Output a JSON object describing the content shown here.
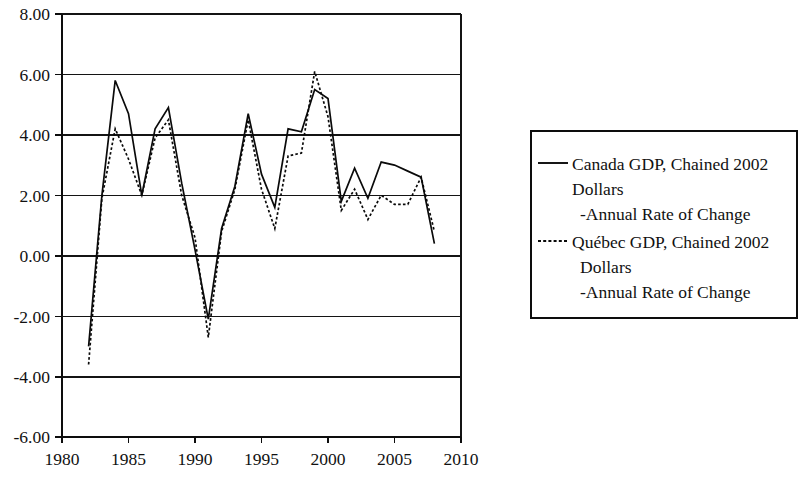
{
  "chart_data": {
    "type": "line",
    "title": "",
    "subtitle": "",
    "xlabel": "",
    "ylabel": "",
    "xlim": [
      1980,
      2010
    ],
    "ylim": [
      -6.0,
      8.0
    ],
    "grid": true,
    "legend_position": "right",
    "x_ticks": [
      "1980",
      "1985",
      "1990",
      "1995",
      "2000",
      "2005",
      "2010"
    ],
    "x_tick_values": [
      1980,
      1985,
      1990,
      1995,
      2000,
      2005,
      2010
    ],
    "y_ticks": [
      "8.00",
      "6.00",
      "4.00",
      "2.00",
      "0.00",
      "-2.00",
      "-4.00",
      "-6.00"
    ],
    "y_tick_values": [
      8.0,
      6.0,
      4.0,
      2.0,
      0.0,
      -2.0,
      -4.0,
      -6.0
    ],
    "x": [
      1982,
      1983,
      1984,
      1985,
      1986,
      1987,
      1988,
      1989,
      1990,
      1991,
      1992,
      1993,
      1994,
      1995,
      1996,
      1997,
      1998,
      1999,
      2000,
      2001,
      2002,
      2003,
      2004,
      2005,
      2006,
      2007,
      2008
    ],
    "series": [
      {
        "name": "Canada GDP, Chained 2002 Dollars -Annual Rate of Change",
        "style": "solid",
        "color": "#0a0a0a",
        "values": [
          -3.0,
          2.0,
          5.8,
          4.7,
          2.0,
          4.2,
          4.9,
          2.4,
          0.2,
          -2.1,
          0.9,
          2.3,
          4.7,
          2.7,
          1.6,
          4.2,
          4.1,
          5.5,
          5.2,
          1.8,
          2.9,
          1.9,
          3.1,
          3.0,
          2.8,
          2.6,
          0.4
        ]
      },
      {
        "name": "Québec GDP, Chained 2002 Dollars -Annual Rate of Change",
        "style": "dashed",
        "color": "#0a0a0a",
        "values": [
          -3.6,
          1.9,
          4.2,
          3.2,
          2.0,
          3.9,
          4.5,
          2.0,
          0.6,
          -2.7,
          0.8,
          2.2,
          4.5,
          2.2,
          0.9,
          3.3,
          3.4,
          6.1,
          4.6,
          1.5,
          2.2,
          1.2,
          2.0,
          1.7,
          1.7,
          2.6,
          0.8
        ]
      }
    ]
  },
  "legend": {
    "entries": [
      {
        "swatch": "solid-line-sample",
        "line1": "Canada GDP, Chained 2002",
        "line2": "Dollars",
        "line3": "-Annual Rate of Change"
      },
      {
        "swatch": "dashed-line-sample",
        "line1": "Québec GDP, Chained 2002",
        "line2": "Dollars",
        "line3": "-Annual Rate of Change"
      }
    ]
  }
}
